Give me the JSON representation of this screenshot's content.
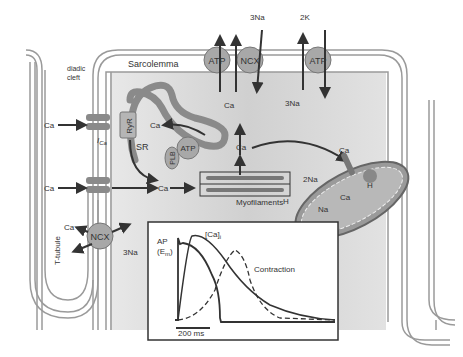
{
  "diagram": {
    "labels": {
      "sarcolemma": "Sarcolemma",
      "diadic_cleft_line1": "diadic",
      "diadic_cleft_line2": "cleft",
      "t_tubule": "T-tubule",
      "sr": "SR",
      "ryr": "RyR",
      "plb": "PLB",
      "ica": "I",
      "ica_sub": "Ca",
      "myofilaments": "Myofilaments"
    },
    "pumps": {
      "atp_sr": "ATP",
      "atp_sarcolemma": "ATP",
      "ncx_top": "NCX",
      "atp_nak": "ATP",
      "ncx_ttubule": "NCX"
    },
    "ions": {
      "ca_in_1": "Ca",
      "ca_in_2": "Ca",
      "ca_ryr_release": "Ca",
      "ca_cytosol": "Ca",
      "ca_top_atp": "Ca",
      "ca_center": "Ca",
      "na3_top": "3Na",
      "na3_under": "3Na",
      "k2": "2K",
      "ca_mito_in": "Ca",
      "na2_mito": "2Na",
      "ca_mito_out": "Ca",
      "h_mito_left": "H",
      "na_mito": "Na",
      "h_mito_right": "H",
      "ca_ttubule": "Ca",
      "na3_ttubule": "3Na"
    },
    "inset": {
      "ap_label": "AP",
      "em_label": "(E",
      "em_sub": "m",
      "em_close": ")",
      "ca_label": "[Ca]",
      "ca_sub": "i",
      "contraction_label": "Contraction",
      "scale_bar": "200 ms"
    }
  },
  "colors": {
    "membrane": "#9a9a9a",
    "cytosol": "#d6d6d6",
    "sr": "#8a8a8a",
    "pump": "#a8a8a8",
    "arrow": "#3a3a3a",
    "text": "#333333"
  }
}
